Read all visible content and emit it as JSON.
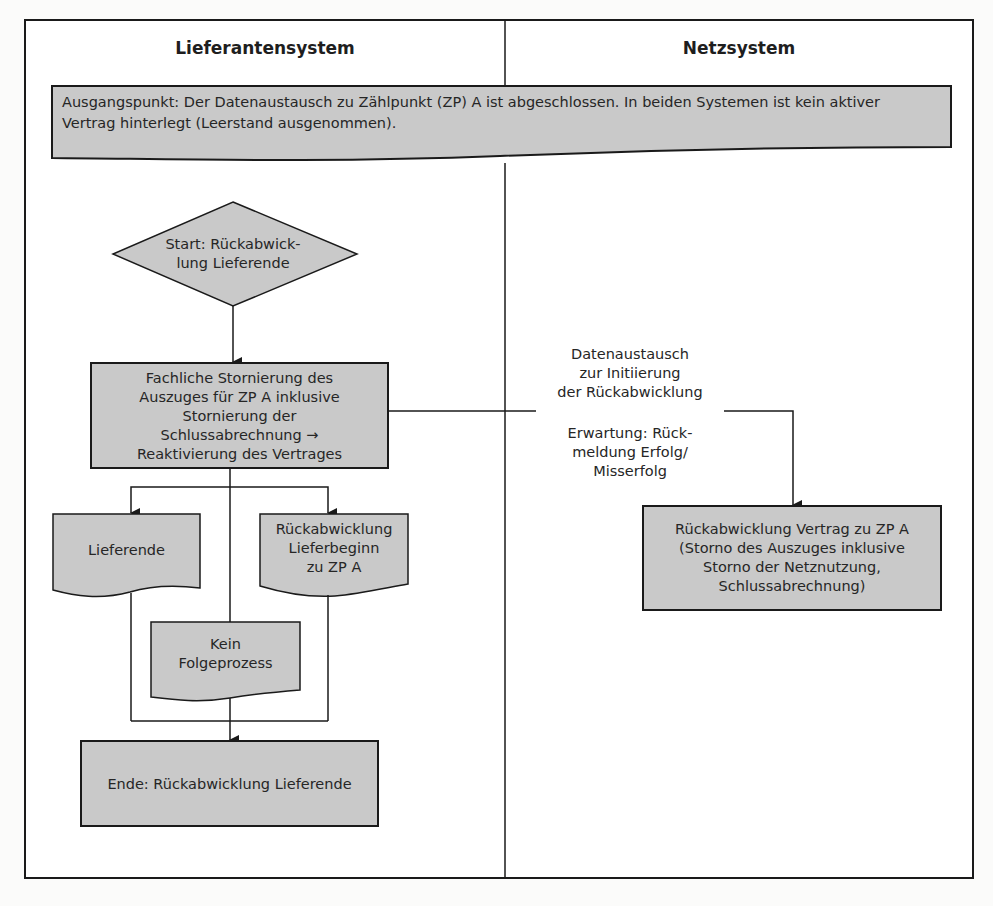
{
  "lanes": {
    "left": {
      "title": "Lieferantensystem"
    },
    "right": {
      "title": "Netzsystem"
    }
  },
  "nodes": {
    "start_condition": {
      "type": "document",
      "text": "Ausgangspunkt: Der Datenaustausch zu Zählpunkt (ZP) A ist abgeschlossen. In beiden Systemen ist kein aktiver\nVertrag hinterlegt (Leerstand ausgenommen)."
    },
    "start_event": {
      "type": "decision",
      "text": "Start: Rückabwick-\nlung Lieferende"
    },
    "cancel_process": {
      "type": "process",
      "text": "Fachliche Stornierung des\nAuszuges für ZP A inklusive\nStornierung der\nSchlussabrechnung →\nReaktivierung des Vertrages"
    },
    "doc_lieferende": {
      "type": "document",
      "text": "Lieferende"
    },
    "doc_rueckabwicklung_lieferbeginn": {
      "type": "document",
      "text": "Rückabwicklung\nLieferbeginn\nzu ZP A"
    },
    "doc_kein_folgeprozess": {
      "type": "document",
      "text": "Kein\nFolgeprozess"
    },
    "end_event": {
      "type": "process",
      "text": "Ende: Rückabwicklung Lieferende"
    },
    "net_reversal": {
      "type": "process",
      "text": "Rückabwicklung Vertrag zu ZP A\n(Storno des Auszuges inklusive\nStorno der Netznutzung,\nSchlussabrechnung)"
    }
  },
  "edges": {
    "exchange_label": "Datenaustausch\nzur Initiierung\nder Rückabwicklung",
    "expectation_label": "Erwartung: Rück-\nmeldung Erfolg/\nMisserfolg"
  },
  "colors": {
    "shape_fill": "#c9c9c9",
    "stroke": "#1a1a1a",
    "background": "#fbfbfa"
  }
}
